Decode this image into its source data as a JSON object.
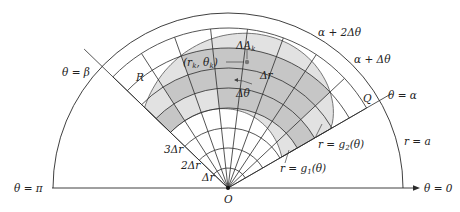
{
  "figure": {
    "type": "polar-region-partition",
    "colors": {
      "line": "#333333",
      "region_light": "#e3e3e3",
      "region_dark": "#c6c6c6",
      "background": "#ffffff"
    },
    "geometry": {
      "origin": [
        228,
        188
      ],
      "outer_radius_a": 175,
      "alpha_deg": 30,
      "beta_deg": 136,
      "delta_r": 20,
      "grid_arcs": 8,
      "grid_sectors": 8
    }
  },
  "labels": {
    "theta_beta": "θ = β",
    "theta_alpha": "θ = α",
    "theta_pi": "θ = π",
    "theta_zero": "θ = 0",
    "region": "R",
    "delta_A_k": "ΔA",
    "delta_A_k_sub": "k",
    "point": "(r",
    "point_sub1": "k",
    "point_mid": ", θ",
    "point_sub2": "k",
    "point_end": ")",
    "delta_r": "Δr",
    "delta_theta": "Δθ",
    "alpha_plus_2dtheta": "α + 2Δθ",
    "alpha_plus_dtheta": "α + Δθ",
    "Q": "Q",
    "r_equals_a": "r = a",
    "r_g2": "r = g",
    "r_g2_sub": "2",
    "r_g2_arg": "(θ)",
    "r_g1": "r = g",
    "r_g1_sub": "1",
    "r_g1_arg": "(θ)",
    "three_dr": "3Δr",
    "two_dr": "2Δr",
    "one_dr": "Δr",
    "origin": "O"
  }
}
